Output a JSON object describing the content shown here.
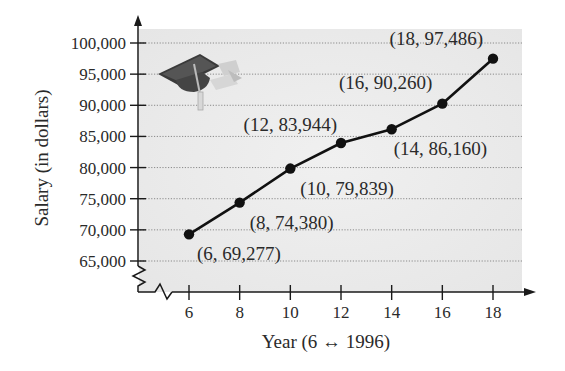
{
  "chart_data": {
    "type": "line",
    "title": "",
    "xlabel": "Year (6 ↔ 1996)",
    "ylabel": "Salary (in dollars)",
    "x": [
      6,
      8,
      10,
      12,
      14,
      16,
      18
    ],
    "series": [
      {
        "name": "Salary",
        "values": [
          69277,
          74380,
          79839,
          83944,
          86160,
          90260,
          97486
        ]
      }
    ],
    "point_labels": [
      "(6, 69,277)",
      "(8, 74,380)",
      "(10, 79,839)",
      "(12, 83,944)",
      "(14, 86,160)",
      "(16, 90,260)",
      "(18, 97,486)"
    ],
    "xticks": [
      "6",
      "8",
      "10",
      "12",
      "14",
      "16",
      "18"
    ],
    "yticks": [
      "65,000",
      "70,000",
      "75,000",
      "80,000",
      "85,000",
      "90,000",
      "95,000",
      "100,000"
    ],
    "ytick_values": [
      65000,
      70000,
      75000,
      80000,
      85000,
      90000,
      95000,
      100000
    ],
    "xlim": [
      4,
      19
    ],
    "ylim": [
      60000,
      102000
    ],
    "grid": "horizontal dotted",
    "axis_breaks": [
      "x",
      "y"
    ],
    "legend": "none",
    "decoration": "graduation-cap-icon"
  },
  "colors": {
    "line": "#111111",
    "plot_background": "#ececec",
    "grid": "#8a8a8a",
    "text": "#2a2a2a"
  }
}
